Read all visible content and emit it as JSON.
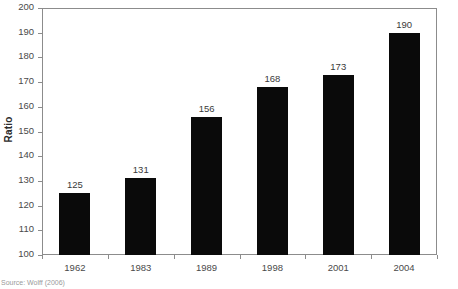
{
  "chart_data": {
    "type": "bar",
    "title": "",
    "xlabel": "",
    "ylabel": "Ratio",
    "categories": [
      "1962",
      "1983",
      "1989",
      "1998",
      "2001",
      "2004"
    ],
    "values": [
      125,
      131,
      156,
      168,
      173,
      190
    ],
    "ylim": [
      100,
      200
    ],
    "ytick_step": 10,
    "yticks": [
      100,
      110,
      120,
      130,
      140,
      150,
      160,
      170,
      180,
      190,
      200
    ],
    "ytick_labels": [
      "100",
      "110",
      "120",
      "130",
      "140",
      "150",
      "160",
      "170",
      "180",
      "190",
      "200"
    ],
    "value_labels": [
      "125",
      "131",
      "156",
      "168",
      "173",
      "190"
    ],
    "grid": false,
    "legend": null,
    "bar_color": "#0a0a0a",
    "frame_color": "#8c8c8c",
    "background": "#ffffff"
  },
  "source_note": "Source: Wolff (2006)"
}
